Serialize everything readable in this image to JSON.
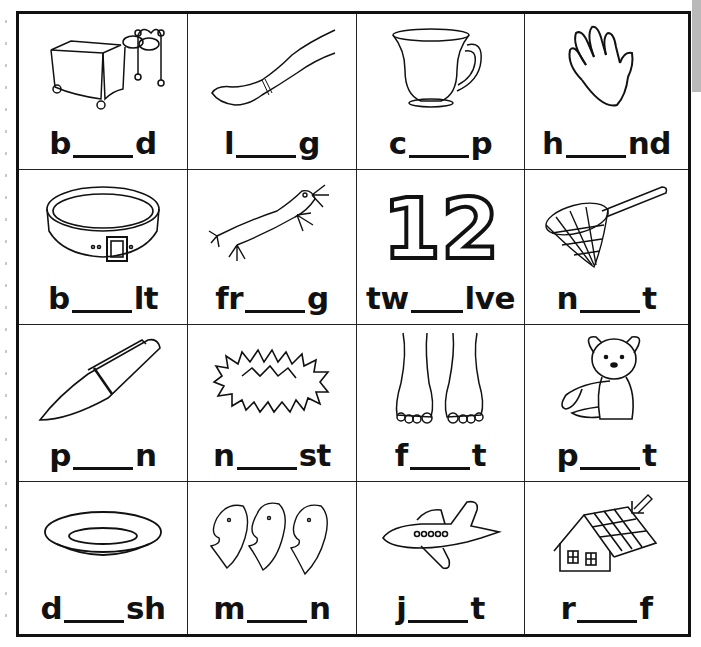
{
  "worksheet": {
    "cells": [
      {
        "picture": "bed",
        "prefix": "b",
        "suffix": "d",
        "answer": "e"
      },
      {
        "picture": "leg",
        "prefix": "l",
        "suffix": "g",
        "answer": "e"
      },
      {
        "picture": "cup",
        "prefix": "c",
        "suffix": "p",
        "answer": "u"
      },
      {
        "picture": "hand",
        "prefix": "h",
        "suffix": "nd",
        "answer": "a"
      },
      {
        "picture": "belt",
        "prefix": "b",
        "suffix": "lt",
        "answer": "e"
      },
      {
        "picture": "frog",
        "prefix": "fr",
        "suffix": "g",
        "answer": "o"
      },
      {
        "picture": "twelve",
        "prefix": "tw",
        "suffix": "lve",
        "answer": "e"
      },
      {
        "picture": "net",
        "prefix": "n",
        "suffix": "t",
        "answer": "e"
      },
      {
        "picture": "pen",
        "prefix": "p",
        "suffix": "n",
        "answer": "e"
      },
      {
        "picture": "nest",
        "prefix": "n",
        "suffix": "st",
        "answer": "e"
      },
      {
        "picture": "feet",
        "prefix": "f",
        "suffix": "t",
        "answer": "ee"
      },
      {
        "picture": "pet",
        "prefix": "p",
        "suffix": "t",
        "answer": "e"
      },
      {
        "picture": "dish",
        "prefix": "d",
        "suffix": "sh",
        "answer": "i"
      },
      {
        "picture": "men",
        "prefix": "m",
        "suffix": "n",
        "answer": "e"
      },
      {
        "picture": "jet",
        "prefix": "j",
        "suffix": "t",
        "answer": "e"
      },
      {
        "picture": "roof",
        "prefix": "r",
        "suffix": "f",
        "answer": "oo"
      }
    ],
    "twelve_numeral": "12",
    "colors": {
      "ink": "#111111",
      "paper": "#ffffff",
      "side_strip": "#b9b9b9"
    }
  }
}
